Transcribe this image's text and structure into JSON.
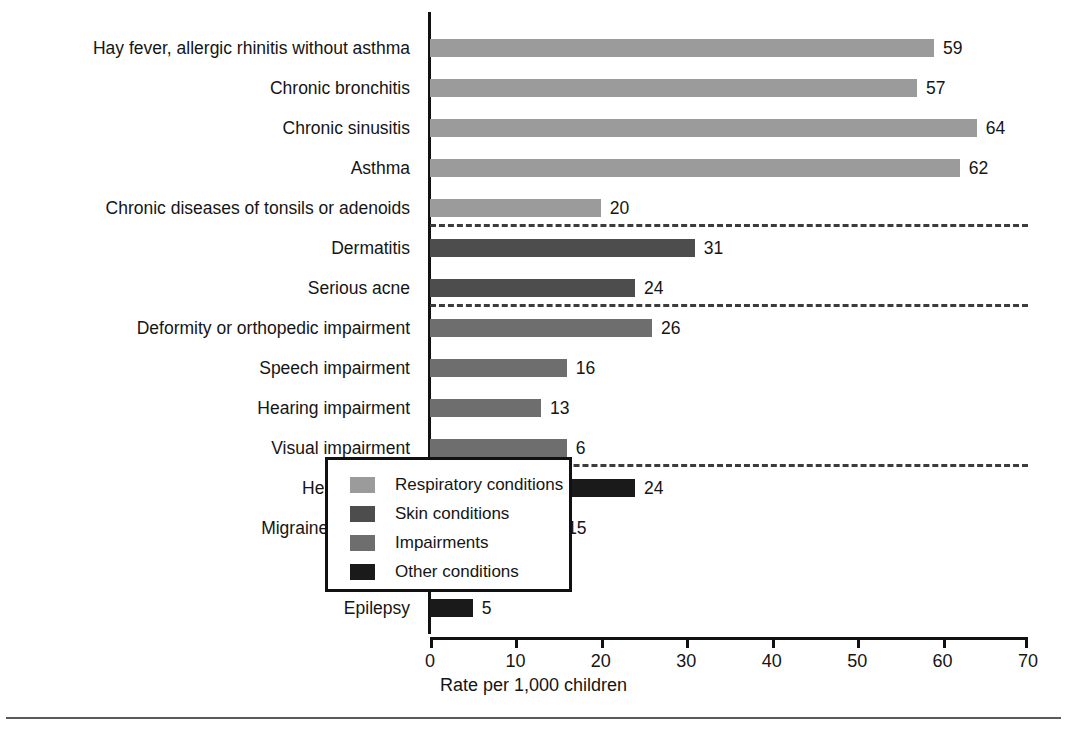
{
  "chart_data": {
    "type": "bar",
    "orientation": "horizontal",
    "title": "",
    "xlabel": "Rate per 1,000 children",
    "ylabel": "",
    "xlim": [
      0,
      70
    ],
    "xticks": [
      0,
      10,
      20,
      30,
      40,
      50,
      60,
      70
    ],
    "grid": false,
    "legend_position": "inside-bottom-right",
    "categories": [
      "Hay fever, allergic rhinitis without asthma",
      "Chronic bronchitis",
      "Chronic sinusitis",
      "Asthma",
      "Chronic diseases of tonsils or adenoids",
      "Dermatitis",
      "Serious acne",
      "Deformity or orthopedic impairment",
      "Speech impairment",
      "Hearing impairment",
      "Visual impairment",
      "Heart disease",
      "Migraine headache",
      "Anemia",
      "Epilepsy"
    ],
    "values": [
      59,
      57,
      64,
      62,
      20,
      31,
      24,
      26,
      16,
      13,
      6,
      24,
      15,
      5,
      5
    ],
    "bar_lengths": [
      59,
      57,
      64,
      62,
      20,
      31,
      24,
      26,
      16,
      13,
      16,
      24,
      15,
      5,
      5
    ],
    "groups": [
      "Respiratory conditions",
      "Respiratory conditions",
      "Respiratory conditions",
      "Respiratory conditions",
      "Respiratory conditions",
      "Skin conditions",
      "Skin conditions",
      "Impairments",
      "Impairments",
      "Impairments",
      "Impairments",
      "Other conditions",
      "Other conditions",
      "Other conditions",
      "Other conditions"
    ],
    "value_labels": [
      "59",
      "57",
      "64",
      "62",
      "20",
      "31",
      "24",
      "26",
      "16",
      "13",
      "6",
      "24",
      "15",
      "5",
      "5"
    ],
    "group_separators_after": [
      4,
      6,
      10
    ],
    "series": [
      {
        "name": "Respiratory conditions",
        "color": "#9b9b9b",
        "points": [
          {
            "category": "Hay fever, allergic rhinitis without asthma",
            "value": 59
          },
          {
            "category": "Chronic bronchitis",
            "value": 57
          },
          {
            "category": "Chronic sinusitis",
            "value": 64
          },
          {
            "category": "Asthma",
            "value": 62
          },
          {
            "category": "Chronic diseases of tonsils or adenoids",
            "value": 20
          }
        ]
      },
      {
        "name": "Skin conditions",
        "color": "#4d4d4d",
        "points": [
          {
            "category": "Dermatitis",
            "value": 31
          },
          {
            "category": "Serious acne",
            "value": 24
          }
        ]
      },
      {
        "name": "Impairments",
        "color": "#6e6e6e",
        "points": [
          {
            "category": "Deformity or orthopedic impairment",
            "value": 26
          },
          {
            "category": "Speech impairment",
            "value": 16
          },
          {
            "category": "Hearing impairment",
            "value": 13
          },
          {
            "category": "Visual impairment",
            "value": 6
          }
        ]
      },
      {
        "name": "Other conditions",
        "color": "#1a1a1a",
        "points": [
          {
            "category": "Heart disease",
            "value": 24
          },
          {
            "category": "Migraine headache",
            "value": 15
          },
          {
            "category": "Anemia",
            "value": 5
          },
          {
            "category": "Epilepsy",
            "value": 5
          }
        ]
      }
    ],
    "legend": [
      {
        "label": "Respiratory conditions",
        "color": "#9b9b9b"
      },
      {
        "label": "Skin conditions",
        "color": "#4d4d4d"
      },
      {
        "label": "Impairments",
        "color": "#6e6e6e"
      },
      {
        "label": "Other conditions",
        "color": "#1a1a1a"
      }
    ]
  }
}
